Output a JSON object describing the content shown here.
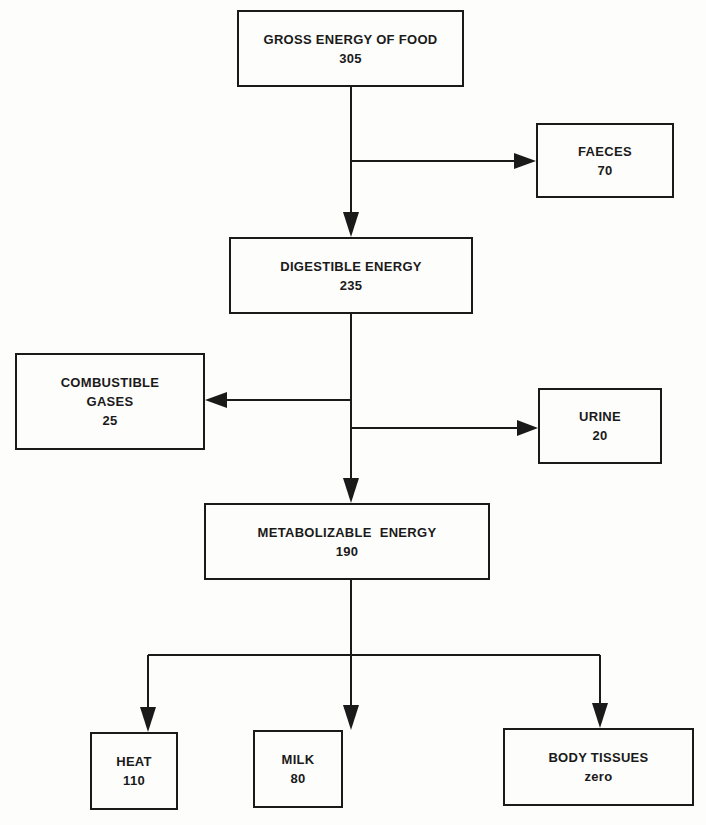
{
  "diagram": {
    "nodes": {
      "gross": {
        "label": "GROSS ENERGY OF FOOD",
        "value": "305"
      },
      "faeces": {
        "label": "FAECES",
        "value": "70"
      },
      "digestible": {
        "label": "DIGESTIBLE ENERGY",
        "value": "235"
      },
      "combustible": {
        "label_line1": "COMBUSTIBLE",
        "label_line2": "GASES",
        "value": "25"
      },
      "urine": {
        "label": "URINE",
        "value": "20"
      },
      "metabolizable": {
        "label": "METABOLIZABLE ENERGY",
        "value": "190"
      },
      "heat": {
        "label": "HEAT",
        "value": "110"
      },
      "milk": {
        "label": "MILK",
        "value": "80"
      },
      "body_tissues": {
        "label": "BODY TISSUES",
        "value": "zero"
      }
    },
    "edges": [
      {
        "from": "gross",
        "to": "faeces"
      },
      {
        "from": "gross",
        "to": "digestible"
      },
      {
        "from": "digestible",
        "to": "combustible"
      },
      {
        "from": "digestible",
        "to": "urine"
      },
      {
        "from": "digestible",
        "to": "metabolizable"
      },
      {
        "from": "metabolizable",
        "to": "heat"
      },
      {
        "from": "metabolizable",
        "to": "milk"
      },
      {
        "from": "metabolizable",
        "to": "body_tissues"
      }
    ],
    "colors": {
      "ink": "#1a1a1a",
      "paper": "#fdfdfc"
    }
  }
}
